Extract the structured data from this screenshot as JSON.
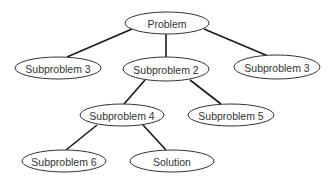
{
  "diagram": {
    "type": "tree",
    "colors": {
      "edge": "#1a1a1a",
      "node_stroke": "#333333",
      "node_fill": "#ffffff",
      "text": "#333333",
      "background": "#ffffff"
    },
    "nodes": [
      {
        "id": "problem",
        "label": "Problem",
        "cx": 167,
        "cy": 23,
        "rx": 42,
        "ry": 11
      },
      {
        "id": "sub3-left",
        "label": "Subproblem 3",
        "cx": 58,
        "cy": 68,
        "rx": 43,
        "ry": 11
      },
      {
        "id": "sub2",
        "label": "Subproblem 2",
        "cx": 166,
        "cy": 69,
        "rx": 43,
        "ry": 12
      },
      {
        "id": "sub3-right",
        "label": "Subproblem 3",
        "cx": 277,
        "cy": 67,
        "rx": 43,
        "ry": 12
      },
      {
        "id": "sub4",
        "label": "Subproblem 4",
        "cx": 122,
        "cy": 115,
        "rx": 42,
        "ry": 11
      },
      {
        "id": "sub5",
        "label": "Subproblem 5",
        "cx": 231,
        "cy": 115,
        "rx": 43,
        "ry": 11
      },
      {
        "id": "sub6",
        "label": "Subproblem 6",
        "cx": 64,
        "cy": 161,
        "rx": 42,
        "ry": 11
      },
      {
        "id": "solution",
        "label": "Solution",
        "cx": 172,
        "cy": 161,
        "rx": 42,
        "ry": 11
      }
    ],
    "edges": [
      {
        "from": "problem",
        "to": "sub3-left",
        "x1": 132,
        "y1": 29,
        "x2": 67,
        "y2": 57
      },
      {
        "from": "problem",
        "to": "sub2",
        "x1": 166,
        "y1": 34,
        "x2": 166,
        "y2": 57
      },
      {
        "from": "problem",
        "to": "sub3-right",
        "x1": 204,
        "y1": 29,
        "x2": 268,
        "y2": 56
      },
      {
        "from": "sub2",
        "to": "sub4",
        "x1": 145,
        "y1": 80,
        "x2": 124,
        "y2": 104
      },
      {
        "from": "sub2",
        "to": "sub5",
        "x1": 190,
        "y1": 80,
        "x2": 221,
        "y2": 104
      },
      {
        "from": "sub4",
        "to": "sub6",
        "x1": 97,
        "y1": 125,
        "x2": 66,
        "y2": 150
      },
      {
        "from": "sub4",
        "to": "solution",
        "x1": 143,
        "y1": 125,
        "x2": 166,
        "y2": 150
      }
    ]
  }
}
